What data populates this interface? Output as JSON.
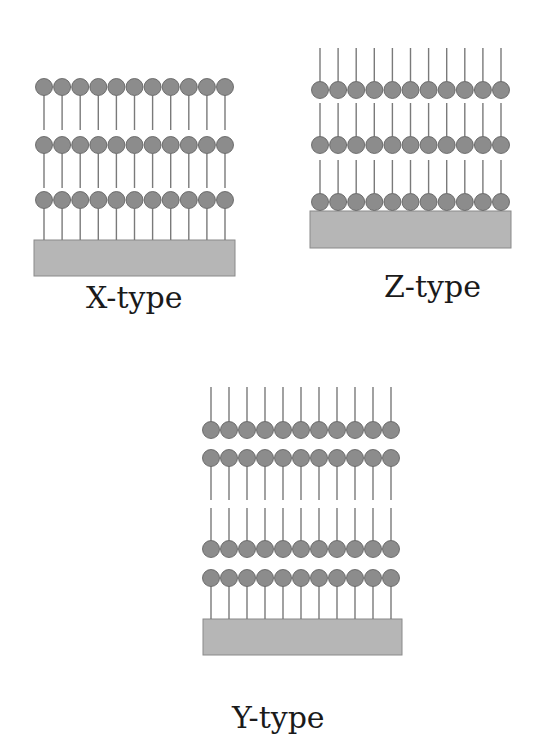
{
  "colors": {
    "head_fill": "#8c8c8c",
    "head_stroke": "#5a5a5a",
    "tail": "#7a7a7a",
    "substrate_fill": "#b6b6b6",
    "substrate_stroke": "#8a8a8a",
    "label": "#1a1a1a"
  },
  "molecules_per_row": 11,
  "panels": [
    {
      "id": "x-type",
      "label": "X-type",
      "label_pos": {
        "x": 86,
        "y": 283
      },
      "head_radius": 8.5,
      "x_start": 44,
      "x_step": 18.1,
      "substrate": {
        "x": 34,
        "y": 240,
        "w": 201,
        "h": 36
      },
      "rows": [
        {
          "cy": 87,
          "tail_dir": "down",
          "tail_end": 130
        },
        {
          "cy": 145,
          "tail_dir": "down",
          "tail_end": 188
        },
        {
          "cy": 200,
          "tail_dir": "down",
          "tail_end": 240
        }
      ]
    },
    {
      "id": "z-type",
      "label": "Z-type",
      "label_pos": {
        "x": 384,
        "y": 272
      },
      "head_radius": 8.5,
      "x_start": 320,
      "x_step": 18.1,
      "substrate": {
        "x": 310,
        "y": 211,
        "w": 201,
        "h": 37
      },
      "rows": [
        {
          "cy": 90,
          "tail_dir": "up",
          "tail_end": 48
        },
        {
          "cy": 145,
          "tail_dir": "up",
          "tail_end": 103
        },
        {
          "cy": 202,
          "tail_dir": "up",
          "tail_end": 160
        }
      ]
    },
    {
      "id": "y-type",
      "label": "Y-type",
      "label_pos": {
        "x": 232,
        "y": 703
      },
      "head_radius": 8.5,
      "x_start": 211,
      "x_step": 18.0,
      "substrate": {
        "x": 203,
        "y": 619,
        "w": 199,
        "h": 36
      },
      "rows": [
        {
          "cy": 430,
          "tail_dir": "up",
          "tail_end": 387
        },
        {
          "cy": 458,
          "tail_dir": "down",
          "tail_end": 500
        },
        {
          "cy": 549,
          "tail_dir": "up",
          "tail_end": 508
        },
        {
          "cy": 578,
          "tail_dir": "down",
          "tail_end": 619
        }
      ]
    }
  ]
}
